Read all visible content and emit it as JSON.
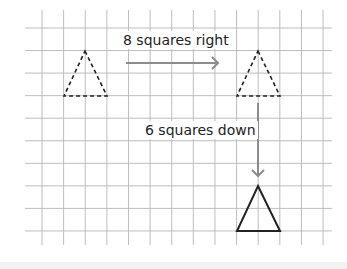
{
  "diagram": {
    "grid": {
      "columns_lines": 14,
      "row_lines": 10,
      "x0": 42,
      "dx": 21.62,
      "y0": 28,
      "dy": 22.55,
      "h_line_x_start": 25,
      "h_line_x_end": 332,
      "v_line_y_start": 10,
      "v_line_y_end": 245,
      "line_color": "#bdbdbd"
    },
    "shapes": {
      "original_triangle": {
        "style": "dashed",
        "apex": [
          85,
          51
        ],
        "base_left": [
          64,
          96
        ],
        "base_right": [
          107,
          96
        ],
        "color": "#222222"
      },
      "intermediate_triangle": {
        "style": "dashed",
        "apex": [
          258,
          51
        ],
        "base_left": [
          237,
          96
        ],
        "base_right": [
          280,
          96
        ],
        "color": "#222222"
      },
      "final_triangle": {
        "style": "solid",
        "apex": [
          258,
          186
        ],
        "base_left": [
          237,
          231
        ],
        "base_right": [
          280,
          231
        ],
        "color": "#222222"
      }
    },
    "arrows": {
      "right": {
        "from": [
          126,
          63
        ],
        "to": [
          218,
          63
        ],
        "color": "#8c8c8c"
      },
      "down": {
        "from": [
          258,
          103
        ],
        "to": [
          258,
          176
        ],
        "color": "#8c8c8c"
      }
    },
    "labels": {
      "right_move": "8 squares right",
      "down_move": "6 squares down"
    }
  }
}
